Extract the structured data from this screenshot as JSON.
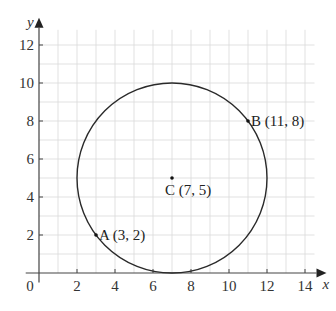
{
  "chart_data": {
    "type": "scatter",
    "title": "",
    "xlabel": "x",
    "ylabel": "y",
    "xlim": [
      0,
      14.5
    ],
    "ylim": [
      0,
      12.8
    ],
    "x_ticks": [
      2,
      4,
      6,
      8,
      10,
      12,
      14
    ],
    "y_ticks": [
      2,
      4,
      6,
      8,
      10,
      12
    ],
    "origin_label": "0",
    "grid": true,
    "grid_minor_step": 1,
    "points": [
      {
        "name": "A",
        "x": 3,
        "y": 2,
        "label": "A (3, 2)"
      },
      {
        "name": "B",
        "x": 11,
        "y": 8,
        "label": "B (11, 8)"
      },
      {
        "name": "C",
        "x": 7,
        "y": 5,
        "label": "C (7, 5)"
      }
    ],
    "shapes": [
      {
        "type": "circle",
        "center": [
          7,
          5
        ],
        "radius": 5,
        "through": [
          "A",
          "B"
        ]
      }
    ],
    "legend": null
  },
  "colors": {
    "grid": "#d9d9d9",
    "axis": "#444444",
    "curve": "#2a2a2a",
    "text": "#333333"
  }
}
